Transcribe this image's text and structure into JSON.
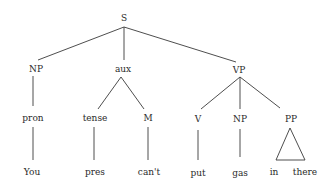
{
  "diagram": {
    "type": "syntax-tree",
    "root": {
      "label": "S",
      "children": [
        {
          "label": "NP",
          "children": [
            {
              "label": "pron",
              "children": [
                {
                  "label": "You"
                }
              ]
            }
          ]
        },
        {
          "label": "aux",
          "children": [
            {
              "label": "tense",
              "children": [
                {
                  "label": "pres"
                }
              ]
            },
            {
              "label": "M",
              "children": [
                {
                  "label": "can't"
                }
              ]
            }
          ]
        },
        {
          "label": "VP",
          "children": [
            {
              "label": "V",
              "children": [
                {
                  "label": "put"
                }
              ]
            },
            {
              "label": "NP",
              "children": [
                {
                  "label": "gas"
                }
              ]
            },
            {
              "label": "PP",
              "triangle": true,
              "leaves": [
                "in",
                "there"
              ]
            }
          ]
        }
      ]
    }
  },
  "nodes": {
    "s": "S",
    "np": "NP",
    "aux": "aux",
    "vp": "VP",
    "pron": "pron",
    "tense": "tense",
    "m": "M",
    "v": "V",
    "np2": "NP",
    "pp": "PP",
    "you": "You",
    "pres": "pres",
    "cant": "can't",
    "put": "put",
    "gas": "gas",
    "in": "in",
    "there": "there"
  }
}
